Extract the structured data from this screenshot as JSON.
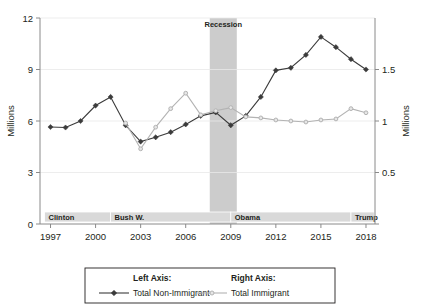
{
  "chart_data": {
    "type": "line",
    "title": "",
    "subtitle": "",
    "xlabel": "",
    "ylabel": "Millions",
    "ylabel_right": "Millions",
    "xlim": [
      1996.3,
      2018.6
    ],
    "ylim": [
      0,
      12
    ],
    "ylim_right": [
      0,
      2
    ],
    "grid": true,
    "legend_position": "bottom",
    "x_ticks": [
      "1997",
      "2000",
      "2003",
      "2006",
      "2009",
      "2012",
      "2015",
      "2018"
    ],
    "x_tick_values": [
      1997,
      2000,
      2003,
      2006,
      2009,
      2012,
      2015,
      2018
    ],
    "y_ticks_left": [
      "0",
      "3",
      "6",
      "9",
      "12"
    ],
    "y_tick_values_left": [
      0,
      3,
      6,
      9,
      12
    ],
    "y_ticks_right": [
      "0.5",
      "1",
      "1.5"
    ],
    "y_tick_values_right": [
      0.5,
      1,
      1.5
    ],
    "x": [
      1997,
      1998,
      1999,
      2000,
      2001,
      2002,
      2003,
      2004,
      2005,
      2006,
      2007,
      2008,
      2009,
      2010,
      2011,
      2012,
      2013,
      2014,
      2015,
      2016,
      2017,
      2018
    ],
    "series": [
      {
        "name": "Total Non-Immigrant",
        "axis": "left",
        "color": "#3b3b3b",
        "marker": "diamond",
        "units": "Millions",
        "values": [
          5.65,
          5.62,
          6.0,
          6.9,
          7.4,
          5.75,
          4.8,
          5.05,
          5.35,
          5.8,
          6.3,
          6.5,
          5.75,
          6.3,
          7.4,
          8.95,
          9.1,
          9.85,
          10.9,
          10.3,
          9.6,
          9.0
        ]
      },
      {
        "name": "Total Immigrant",
        "axis": "right",
        "color": "#b3b3b3",
        "marker": "circle",
        "units": "Millions",
        "values": [
          null,
          null,
          null,
          null,
          null,
          0.98,
          0.73,
          0.94,
          1.12,
          1.27,
          1.06,
          1.1,
          1.13,
          1.04,
          1.03,
          1.01,
          1.0,
          0.99,
          1.01,
          1.02,
          1.12,
          1.08
        ]
      }
    ],
    "annotations": [
      {
        "name": "recession",
        "label": "Recession",
        "type": "vband",
        "x_start": 2007.6,
        "x_end": 2009.4,
        "color": "#cccccc"
      }
    ],
    "presidency_bands": [
      {
        "label": "Clinton",
        "x_start": 1996.6,
        "x_end": 2001.0,
        "color": "#d9d9d9"
      },
      {
        "label": "Bush W.",
        "x_start": 2001.0,
        "x_end": 2009.0,
        "color": "#d9d9d9"
      },
      {
        "label": "Obama",
        "x_start": 2009.0,
        "x_end": 2017.0,
        "color": "#d9d9d9"
      },
      {
        "label": "Trump",
        "x_start": 2017.0,
        "x_end": 2018.55,
        "color": "#d9d9d9"
      }
    ]
  },
  "legend": {
    "left_head": "Left Axis:",
    "right_head": "Right Axis:",
    "left_label": "Total Non-Immigrant",
    "right_label": "Total Immigrant"
  },
  "axes": {
    "left_title": "Millions",
    "right_title": "Millions"
  }
}
